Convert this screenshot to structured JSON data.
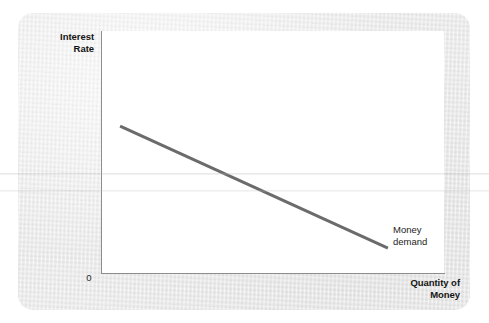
{
  "figure": {
    "background_color": "#ffffff",
    "card_color": "#e9e9e9",
    "panel_color": "#ffffff",
    "axis_color": "#8d8d8d",
    "curve_color": "#6b6b6b"
  },
  "axes": {
    "y_title": "Interest\nRate",
    "x_title": "Quantity of\nMoney",
    "origin_label": "0"
  },
  "annotations": {
    "curve_label": "Money\ndemand"
  },
  "chart_data": {
    "type": "line",
    "title": "",
    "xlabel": "Quantity of Money",
    "ylabel": "Interest Rate",
    "xlim": [
      0,
      100
    ],
    "ylim": [
      0,
      100
    ],
    "grid": false,
    "legend": "none",
    "series": [
      {
        "name": "Money demand",
        "color": "#6b6b6b",
        "linewidth": 3,
        "x": [
          5.3,
          83.6
        ],
        "y": [
          60.7,
          10.3
        ]
      }
    ],
    "annotations": [
      {
        "text": "Money demand",
        "x": 84.5,
        "y": 15.5,
        "attached_to": "Money demand"
      }
    ],
    "tick_labels": {
      "x": [],
      "y": [],
      "origin": "0"
    }
  }
}
